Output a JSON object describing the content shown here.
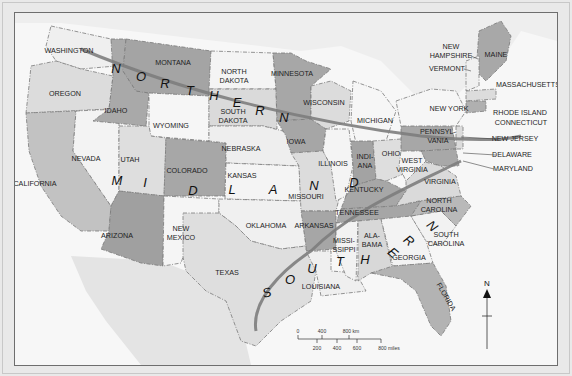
{
  "map": {
    "title": "United States regions",
    "regions": [
      {
        "name": "NORTHERN",
        "letters": [
          "N",
          "O",
          "R",
          "T",
          "H",
          "E",
          "R",
          "N"
        ]
      },
      {
        "name": "MIDLAND",
        "letters": [
          "M",
          "I",
          "D",
          "L",
          "A",
          "N",
          "D"
        ]
      },
      {
        "name": "SOUTHERN",
        "letters": [
          "S",
          "O",
          "U",
          "T",
          "H",
          "E",
          "R",
          "N"
        ]
      }
    ],
    "states": {
      "washington": "WASHINGTON",
      "oregon": "OREGON",
      "california": "CALIFORNIA",
      "idaho": "IDAHO",
      "nevada": "NEVADA",
      "montana": "MONTANA",
      "wyoming": "WYOMING",
      "utah": "UTAH",
      "arizona": "ARIZONA",
      "colorado": "COLORADO",
      "new_mexico_1": "NEW",
      "new_mexico_2": "MEXICO",
      "north_dakota_1": "NORTH",
      "north_dakota_2": "DAKOTA",
      "south_dakota_1": "SOUTH",
      "south_dakota_2": "DAKOTA",
      "nebraska": "NEBRASKA",
      "kansas": "KANSAS",
      "oklahoma": "OKLAHOMA",
      "texas": "TEXAS",
      "minnesota": "MINNESOTA",
      "iowa": "IOWA",
      "missouri": "MISSOURI",
      "arkansas": "ARKANSAS",
      "louisiana": "LOUISIANA",
      "wisconsin": "WISCONSIN",
      "illinois": "ILLINOIS",
      "michigan": "MICHIGAN",
      "indiana_1": "INDI-",
      "indiana_2": "ANA",
      "ohio": "OHIO",
      "kentucky": "KENTUCKY",
      "tennessee": "TENNESSEE",
      "mississippi_1": "MISSI-",
      "mississippi_2": "SSIPPI",
      "alabama_1": "ALA-",
      "alabama_2": "BAMA",
      "georgia": "GEORGIA",
      "florida": "FLORIDA",
      "south_carolina_1": "SOUTH",
      "south_carolina_2": "CAROLINA",
      "north_carolina_1": "NORTH",
      "north_carolina_2": "CAROLINA",
      "virginia": "VIRGINIA",
      "west_virginia_1": "WEST",
      "west_virginia_2": "VIRGINIA",
      "pennsylvania_1": "PENNSYL-",
      "pennsylvania_2": "VANIA",
      "new_york": "NEW YORK",
      "maine": "MAINE"
    },
    "callouts": {
      "new_hampshire_1": "NEW",
      "new_hampshire_2": "HAMPSHIRE",
      "vermont": "VERMONT",
      "massachusetts": "MASSACHUSETTS",
      "rhode_island": "RHODE ISLAND",
      "connecticut": "CONNECTICUT",
      "new_jersey": "NEW JERSEY",
      "delaware": "DELAWARE",
      "maryland": "MARYLAND"
    },
    "scale": {
      "km_ticks": [
        "0",
        "400",
        "800 km"
      ],
      "mile_ticks": [
        "200",
        "400",
        "600",
        "800 miles"
      ]
    },
    "north_arrow": "N",
    "colors": {
      "dark": "#9c9c9c",
      "medium": "#c4c4c4",
      "light": "#dedede",
      "white": "#f8f8f8",
      "water": "#f7f7f7",
      "belt": "#7d7d7d"
    }
  }
}
